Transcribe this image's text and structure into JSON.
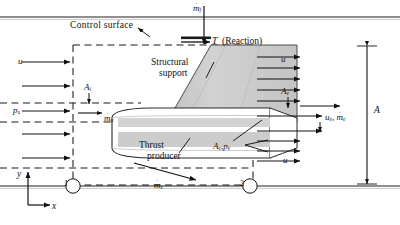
{
  "figure": {
    "title_visible": false,
    "type": "engineering-control-volume-diagram"
  },
  "colors": {
    "line": "#111111",
    "background": "#ffffff",
    "duct_wall": "#9a9a9a",
    "support_fill": "#c9c9c9",
    "nacelle_fill": "#ffffff",
    "nacelle_band": "#cfcfcf",
    "dashed": "#222222"
  },
  "labels": {
    "control_surface": "Control  surface",
    "fuel_flow": "m",
    "fuel_flow_sub": "f",
    "thrust": "T",
    "thrust_note": "(Reaction)",
    "structural_support_line1": "Structural",
    "structural_support_line2": "support",
    "thrust_producer_line1": "Thrust",
    "thrust_producer_line2": "producer",
    "inlet_velocity": "u",
    "ambient_pressure": "p",
    "ambient_pressure_sub": "a",
    "inlet_area": "A",
    "inlet_area_sub": "i",
    "air_flow": "m",
    "air_flow_sub": "a",
    "side_flow": "m",
    "side_flow_sub": "s",
    "exit_area": "A",
    "exit_area_sub": "e",
    "free_velocity_top": "u",
    "free_velocity_bottom": "u",
    "exit_velocity": "u",
    "exit_velocity_sub": "e",
    "exit_flow": "m",
    "exit_flow_sub": "e",
    "exit_area_pressure_A": "A",
    "exit_area_pressure_A_sub": "e",
    "exit_area_pressure_p": "p",
    "exit_area_pressure_p_sub": "e",
    "overall_area": "A",
    "axis_y": "y",
    "axis_x": "x",
    "station_1": "1",
    "station_2": "2"
  }
}
